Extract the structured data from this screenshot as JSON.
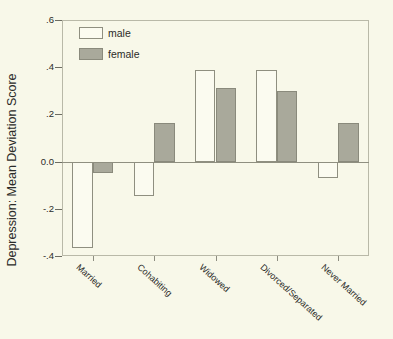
{
  "chart_data": {
    "type": "bar",
    "title": "",
    "xlabel": "",
    "ylabel": "Depression: Mean Deviation Score",
    "categories": [
      "Married",
      "Cohabiting",
      "Widowed",
      "Divorced/Separated",
      "Never Married"
    ],
    "series": [
      {
        "name": "male",
        "values": [
          -0.365,
          -0.145,
          0.39,
          0.39,
          -0.07
        ]
      },
      {
        "name": "female",
        "values": [
          -0.05,
          0.165,
          0.31,
          0.3,
          0.165
        ]
      }
    ],
    "ylim": [
      -0.4,
      0.6
    ],
    "yticks": [
      0.6,
      0.4,
      0.2,
      0.0,
      -0.2,
      -0.4
    ],
    "ytick_labels": [
      ".6",
      ".4",
      ".2",
      "0.0",
      "-.2",
      "-.4"
    ],
    "grid": false,
    "legend": {
      "position": "top-left",
      "entries": [
        {
          "label": "male",
          "color": "#fbfbf0"
        },
        {
          "label": "female",
          "color": "#a9a99b"
        }
      ]
    },
    "colors": {
      "background": "#f8f8e9",
      "male_fill": "#fbfbf0",
      "female_fill": "#a9a99b",
      "axis": "#6d6d62",
      "text": "#2b2b28"
    }
  }
}
